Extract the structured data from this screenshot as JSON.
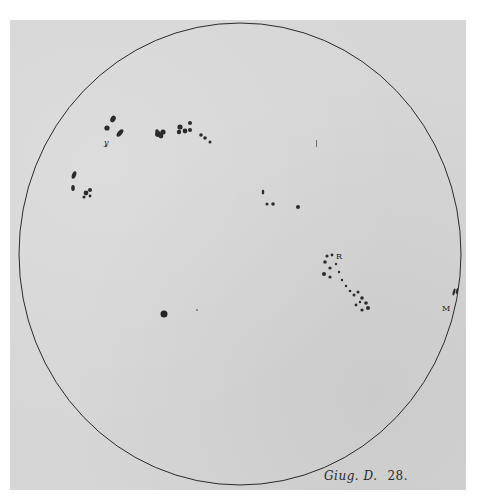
{
  "plate": {
    "caption_text": "Giug. D.",
    "caption_number": "28.",
    "labels": {
      "group_r": "R",
      "limb_m": "M",
      "group_y": "y"
    },
    "colors": {
      "paper": "#d6d6d6",
      "ink": "#2b2b2b",
      "background": "#ffffff"
    },
    "solar_disk": {
      "center": [
        240,
        254
      ],
      "radius_x": 221,
      "radius_y": 232
    }
  }
}
